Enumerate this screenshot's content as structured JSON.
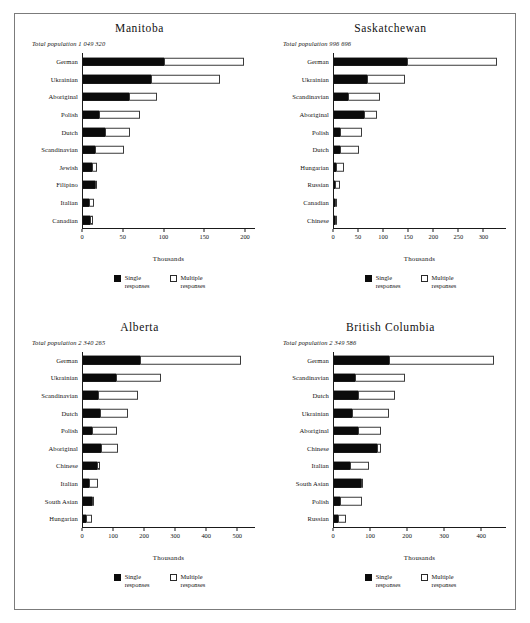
{
  "figure": {
    "axis_title": "Thousands",
    "legend": [
      {
        "key": "single",
        "line1": "Single",
        "line2": "responses",
        "color": "#0b0b0b"
      },
      {
        "key": "multiple",
        "line1": "Multiple",
        "line2": "responses",
        "color": "#ffffff"
      }
    ],
    "frame_color": "#7b7b7b"
  },
  "chart_data": [
    {
      "type": "bar",
      "orientation": "horizontal",
      "stacked": true,
      "title": "Manitoba",
      "subtitle": "Total population 1 049 320",
      "total_population": "1 049 320",
      "xlabel": "Thousands",
      "ylabel": "",
      "xlim": [
        0,
        200
      ],
      "xticks": [
        0,
        50,
        100,
        150,
        200
      ],
      "grid": false,
      "legend_position": "bottom",
      "categories": [
        "German",
        "Ukrainian",
        "Aboriginal",
        "Polish",
        "Dutch",
        "Scandinavian",
        "Jewish",
        "Filipino",
        "Italian",
        "Canadian"
      ],
      "series": [
        {
          "name": "Single responses",
          "values": [
            95,
            80,
            54,
            20,
            27,
            15,
            12,
            16,
            8,
            9
          ]
        },
        {
          "name": "Multiple responses",
          "values": [
            92,
            80,
            33,
            47,
            29,
            34,
            5,
            1,
            6,
            4
          ]
        }
      ]
    },
    {
      "type": "bar",
      "orientation": "horizontal",
      "stacked": true,
      "title": "Saskatchewan",
      "subtitle": "Total population 996 696",
      "total_population": "996 696",
      "xlabel": "Thousands",
      "ylabel": "",
      "xlim": [
        0,
        325
      ],
      "xticks": [
        0,
        50,
        100,
        150,
        200,
        250,
        300
      ],
      "grid": false,
      "legend_position": "bottom",
      "categories": [
        "German",
        "Ukrainian",
        "Scandinavian",
        "Aboriginal",
        "Polish",
        "Dutch",
        "Hungarian",
        "Russian",
        "Canadian",
        "Chinese"
      ],
      "series": [
        {
          "name": "Single responses",
          "values": [
            139,
            63,
            28,
            59,
            13,
            14,
            6,
            3,
            6,
            6
          ]
        },
        {
          "name": "Multiple responses",
          "values": [
            170,
            72,
            61,
            24,
            42,
            35,
            15,
            10,
            1,
            1
          ]
        }
      ]
    },
    {
      "type": "bar",
      "orientation": "horizontal",
      "stacked": true,
      "title": "Alberta",
      "subtitle": "Total population 2 340 265",
      "total_population": "2 340 265",
      "xlabel": "Thousands",
      "ylabel": "",
      "xlim": [
        0,
        525
      ],
      "xticks": [
        0,
        100,
        200,
        300,
        400,
        500
      ],
      "grid": false,
      "legend_position": "bottom",
      "categories": [
        "German",
        "Ukrainian",
        "Scandinavian",
        "Dutch",
        "Polish",
        "Aboriginal",
        "Chinese",
        "Italian",
        "South Asian",
        "Hungarian"
      ],
      "series": [
        {
          "name": "Single responses",
          "values": [
            176,
            104,
            50,
            56,
            31,
            57,
            47,
            21,
            34,
            12
          ]
        },
        {
          "name": "Multiple responses",
          "values": [
            308,
            136,
            120,
            84,
            74,
            53,
            7,
            28,
            2,
            17
          ]
        }
      ]
    },
    {
      "type": "bar",
      "orientation": "horizontal",
      "stacked": true,
      "title": "British Columbia",
      "subtitle": "Total population 2 349 586",
      "total_population": "2 349 586",
      "xlabel": "Thousands",
      "ylabel": "",
      "xlim": [
        0,
        440
      ],
      "xticks": [
        0,
        100,
        200,
        300,
        400
      ],
      "grid": false,
      "legend_position": "bottom",
      "categories": [
        "German",
        "Scandinavian",
        "Dutch",
        "Ukrainian",
        "Aboriginal",
        "Chinese",
        "Italian",
        "South Asian",
        "Polish",
        "Russian"
      ],
      "series": [
        {
          "name": "Single responses",
          "values": [
            143,
            56,
            64,
            48,
            63,
            113,
            44,
            71,
            18,
            13
          ]
        },
        {
          "name": "Multiple responses",
          "values": [
            266,
            126,
            93,
            94,
            60,
            9,
            47,
            5,
            55,
            20
          ]
        }
      ]
    }
  ]
}
